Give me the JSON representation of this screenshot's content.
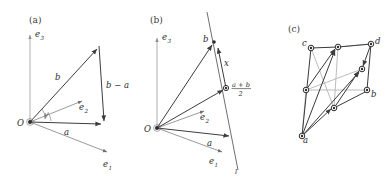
{
  "figure": {
    "width": 391,
    "height": 180,
    "background": "#ffffff",
    "kind": "three-panel vector geometry diagram"
  },
  "colors": {
    "axis": "#8d8d8d",
    "thin_vector": "#6f6f6f",
    "main_vector": "#3d3d3d",
    "dark_edge": "#3a3a3a",
    "grey_edge": "#b4b4b4",
    "node_stroke": "#2e2e2e",
    "text": "#2b2b2b",
    "panel_label": "#3a3a3a"
  },
  "panels": [
    {
      "id": "a",
      "label": "(a)",
      "labels": {
        "origin": "O",
        "e1": "e",
        "e1_sub": "1",
        "e2": "e",
        "e2_sub": "2",
        "e3": "e",
        "e3_sub": "3",
        "a": "a",
        "b": "b",
        "b_minus_a": "b − a",
        "angle": "γ"
      },
      "geometry": {
        "origin": [
          30,
          122
        ],
        "tip_a": [
          104,
          124
        ],
        "tip_b": [
          99,
          46
        ],
        "e1_tip": [
          110,
          155
        ],
        "e2_tip": [
          84,
          100
        ],
        "e3_tip": [
          30,
          33
        ]
      }
    },
    {
      "id": "b",
      "label": "(b)",
      "labels": {
        "origin": "O",
        "e1": "e",
        "e1_sub": "1",
        "e2": "e",
        "e2_sub": "2",
        "e3": "e",
        "e3_sub": "3",
        "a": "a",
        "b": "b",
        "x": "x",
        "midpoint_num": "a + b",
        "midpoint_den": "2",
        "line": "l"
      },
      "geometry": {
        "origin": [
          157,
          128
        ],
        "tip_a": [
          232,
          137
        ],
        "tip_b": [
          214,
          42
        ],
        "midpoint": [
          226,
          88
        ],
        "e1_tip": [
          225,
          155
        ],
        "e2_tip": [
          206,
          110
        ],
        "e3_tip": [
          157,
          36
        ],
        "line_from": [
          208,
          10
        ],
        "line_to": [
          238,
          172
        ]
      }
    },
    {
      "id": "c",
      "label": "(c)",
      "labels": {
        "a": "a",
        "b": "b",
        "c": "c",
        "d": "d"
      },
      "geometry": {
        "nodes": [
          {
            "name": "a",
            "x": 302,
            "y": 136
          },
          {
            "name": "c",
            "x": 311,
            "y": 48
          },
          {
            "name": "d",
            "x": 371,
            "y": 44
          },
          {
            "name": "top_mid",
            "x": 338,
            "y": 47
          },
          {
            "name": "right_mid",
            "x": 362,
            "y": 69
          },
          {
            "name": "left_mid",
            "x": 306,
            "y": 90
          },
          {
            "name": "b",
            "x": 367,
            "y": 90
          },
          {
            "name": "bottom_mid",
            "x": 334,
            "y": 108
          }
        ],
        "dark_edges": [
          [
            "a",
            "c"
          ],
          [
            "c",
            "top_mid"
          ],
          [
            "top_mid",
            "d"
          ],
          [
            "a",
            "top_mid"
          ],
          [
            "a",
            "right_mid"
          ],
          [
            "a",
            "bottom_mid"
          ],
          [
            "bottom_mid",
            "right_mid"
          ],
          [
            "bottom_mid",
            "b"
          ],
          [
            "d",
            "right_mid"
          ],
          [
            "d",
            "b"
          ],
          [
            "left_mid",
            "top_mid"
          ]
        ],
        "grey_edges": [
          [
            "left_mid",
            "right_mid"
          ],
          [
            "left_mid",
            "b"
          ],
          [
            "c",
            "bottom_mid"
          ],
          [
            "top_mid",
            "bottom_mid"
          ],
          [
            "a",
            "left_mid"
          ]
        ]
      }
    }
  ]
}
